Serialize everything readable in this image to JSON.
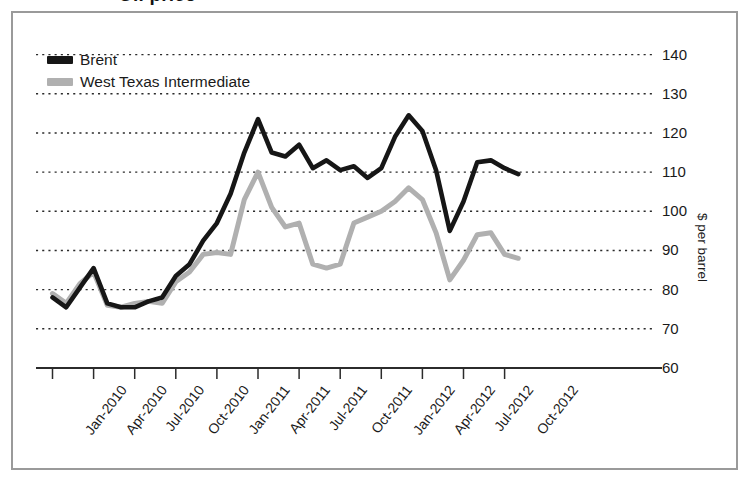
{
  "title_fragment": "Oil price",
  "legend": {
    "position": "top-left",
    "items": [
      {
        "label": "Brent",
        "color": "#161616"
      },
      {
        "label": "West Texas Intermediate",
        "color": "#b0b0b0"
      }
    ]
  },
  "axis": {
    "y_title": "$ per barrel",
    "y_ticks": [
      "140",
      "130",
      "120",
      "110",
      "100",
      "90",
      "80",
      "70",
      "60"
    ],
    "x_ticks": [
      "Jan-2010",
      "Apr-2010",
      "Jul-2010",
      "Oct-2010",
      "Jan-2011",
      "Apr-2011",
      "Jul-2011",
      "Oct-2011",
      "Jan-2012",
      "Apr-2012",
      "Jul-2012",
      "Oct-2012"
    ]
  },
  "chart_data": {
    "type": "line",
    "title": "Oil price",
    "xlabel": "",
    "ylabel": "$ per barrel",
    "ylim": [
      60,
      145
    ],
    "yticks": [
      60,
      70,
      80,
      90,
      100,
      110,
      120,
      130,
      140
    ],
    "grid": "horizontal-dotted",
    "legend_position": "top-left",
    "x": [
      "Jan-2010",
      "Feb-2010",
      "Mar-2010",
      "Apr-2010",
      "May-2010",
      "Jun-2010",
      "Jul-2010",
      "Aug-2010",
      "Sep-2010",
      "Oct-2010",
      "Nov-2010",
      "Dec-2010",
      "Jan-2011",
      "Feb-2011",
      "Mar-2011",
      "Apr-2011",
      "May-2011",
      "Jun-2011",
      "Jul-2011",
      "Aug-2011",
      "Sep-2011",
      "Oct-2011",
      "Nov-2011",
      "Dec-2011",
      "Jan-2012",
      "Feb-2012",
      "Mar-2012",
      "Apr-2012",
      "May-2012",
      "Jun-2012",
      "Jul-2012",
      "Aug-2012",
      "Sep-2012",
      "Oct-2012",
      "Nov-2012"
    ],
    "x_tick_indices": [
      0,
      3,
      6,
      9,
      12,
      15,
      18,
      21,
      24,
      27,
      30,
      33
    ],
    "series": [
      {
        "name": "Brent",
        "color": "#161616",
        "values": [
          78,
          75.5,
          80.5,
          85.5,
          76.5,
          75.5,
          75.5,
          77,
          78,
          83.5,
          86.5,
          92.5,
          97,
          104.5,
          115,
          123.5,
          115,
          114,
          117,
          111,
          113,
          110.5,
          111.5,
          108.5,
          111,
          119,
          124.5,
          120.5,
          110.5,
          95,
          102.5,
          112.5,
          113,
          111,
          109.5
        ]
      },
      {
        "name": "West Texas Intermediate",
        "color": "#b0b0b0",
        "values": [
          79,
          76.5,
          81.5,
          84.5,
          76,
          75.5,
          76.5,
          77,
          76.5,
          82,
          84.5,
          89,
          89.5,
          89,
          103,
          110,
          101,
          96,
          97,
          86.5,
          85.5,
          86.5,
          97,
          98.5,
          100,
          102.5,
          106,
          103,
          94.5,
          82.5,
          87.5,
          94,
          94.5,
          89,
          88
        ]
      }
    ]
  }
}
